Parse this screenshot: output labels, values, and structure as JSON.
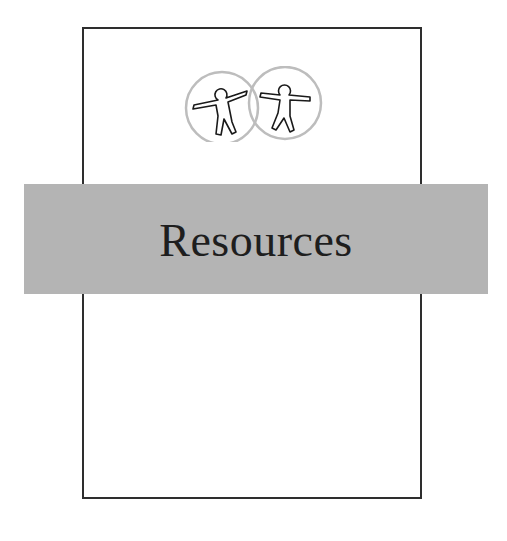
{
  "page": {
    "title": "Resources"
  },
  "logo": {
    "icon": "accessibility-figures-icon",
    "circle_color": "#bdbdbd",
    "figure_color": "#1a1a1a"
  },
  "colors": {
    "band": "#b4b4b4",
    "frame": "#2e2e2e",
    "background": "#ffffff"
  }
}
